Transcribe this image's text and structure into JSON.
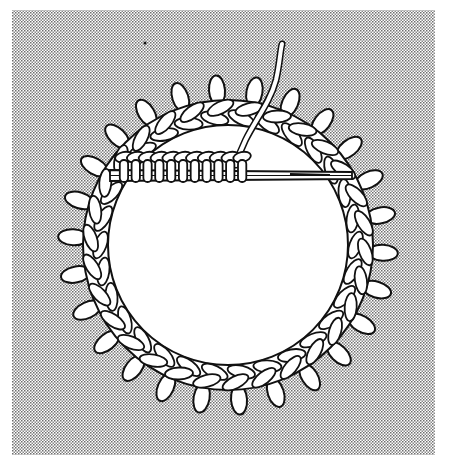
{
  "figure": {
    "colors": {
      "background": "#ffffff",
      "stipple_dot": "#6e6e6e",
      "line": "#111111",
      "fill": "#ffffff"
    },
    "panel": {
      "x": 12,
      "y": 10,
      "width": 423,
      "height": 445
    },
    "ring": {
      "cx": 228,
      "cy": 245,
      "outer_r": 145,
      "inner_r": 120,
      "picot_count": 26,
      "link_count": 30
    },
    "stitch_row": {
      "x_start": 118,
      "x_end": 248,
      "y_top": 150,
      "y_bottom": 182,
      "stitch_count": 11
    },
    "needle": {
      "x1": 248,
      "y1": 172,
      "x2": 352,
      "y2": 176
    },
    "yarn_tail": {
      "top_x": 283,
      "top_y": 45,
      "bottom_x": 236,
      "bottom_y": 160
    }
  }
}
